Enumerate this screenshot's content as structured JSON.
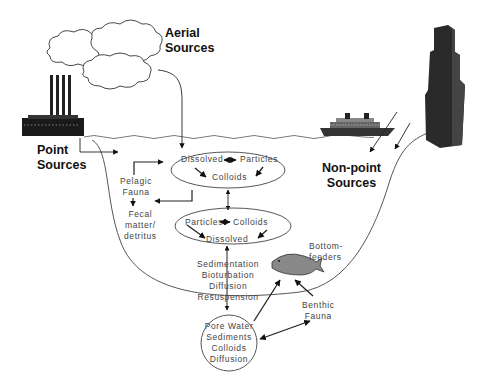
{
  "diagram": {
    "sources": {
      "aerial": [
        "Aerial",
        "Sources"
      ],
      "point": [
        "Point",
        "Sources"
      ],
      "nonpoint": [
        "Non-point",
        "Sources"
      ]
    },
    "upper_ellipse": {
      "dissolved": "Dissolved",
      "particles": "Particles",
      "colloids": "Colloids"
    },
    "lower_ellipse": {
      "particles": "Particles",
      "colloids": "Colloids",
      "dissolved": "Dissolved"
    },
    "pelagic": [
      "Pelagic",
      "Fauna"
    ],
    "fecal": [
      "Fecal",
      "matter/",
      "detritus"
    ],
    "processes": [
      "Sedimentation",
      "Bioturbation",
      "Diffusion",
      "Resuspension"
    ],
    "bottom_feeders": [
      "Bottom-",
      "feeders"
    ],
    "benthic": [
      "Benthic",
      "Fauna"
    ],
    "pore_circle": [
      "Pore Water",
      "Sediments",
      "Colloids",
      "Diffusion"
    ],
    "icons": [
      "cloud-icon",
      "factory-icon",
      "ship-icon",
      "skyscraper-icon",
      "fish-icon"
    ]
  }
}
